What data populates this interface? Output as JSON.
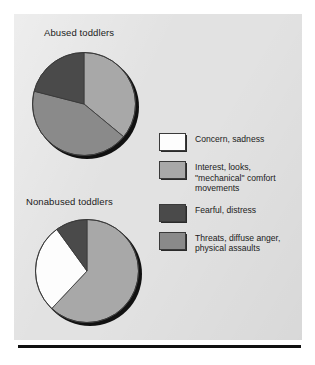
{
  "figure": {
    "background_color": "#e2e2e2",
    "page_color": "#ffffff",
    "rule_color": "#101010"
  },
  "charts": [
    {
      "name": "abused-toddlers",
      "title": "Abused toddlers"
    },
    {
      "name": "nonabused-toddlers",
      "title": "Nonabused toddlers"
    }
  ],
  "legend": {
    "items": [
      {
        "label": "Concern, sadness",
        "color": "#fdfdfd",
        "key": "concern-sadness"
      },
      {
        "label": "Interest, looks,\n\"mechanical\" comfort\nmovements",
        "color": "#a8a8a8",
        "key": "interest-looks"
      },
      {
        "label": "Fearful, distress",
        "color": "#4a4a4a",
        "key": "fearful-distress"
      },
      {
        "label": "Threats, diffuse anger,\nphysical assaults",
        "color": "#8a8a8a",
        "key": "threats-anger"
      }
    ]
  },
  "chart_data": [
    {
      "type": "pie",
      "title": "Abused toddlers",
      "labels": [
        "Interest, looks, \"mechanical\" comfort movements",
        "Threats, diffuse anger, physical assaults",
        "Fearful, distress"
      ],
      "values": [
        36,
        43,
        21
      ],
      "colors": [
        "#a8a8a8",
        "#8a8a8a",
        "#4a4a4a"
      ],
      "start_angle_deg": 0,
      "direction": "clockwise",
      "legend_position": "right"
    },
    {
      "type": "pie",
      "title": "Nonabused toddlers",
      "labels": [
        "Interest, looks, \"mechanical\" comfort movements",
        "Concern, sadness",
        "Fearful, distress"
      ],
      "values": [
        62,
        28,
        10
      ],
      "colors": [
        "#a8a8a8",
        "#fdfdfd",
        "#4a4a4a"
      ],
      "start_angle_deg": 0,
      "direction": "clockwise",
      "legend_position": "right"
    }
  ]
}
